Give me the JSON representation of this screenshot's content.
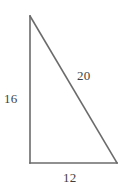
{
  "figure": {
    "name": "right-triangle",
    "background_color": "#ffffff",
    "stroke_color": "#6b6b6b",
    "text_color": "#3f3f3f",
    "stroke_width": 1.6,
    "vertices": {
      "apex": {
        "x": 30,
        "y": 16
      },
      "bottom_left": {
        "x": 30,
        "y": 163
      },
      "bottom_right": {
        "x": 117,
        "y": 163
      }
    },
    "labels": {
      "vertical_leg": "16",
      "hypotenuse": "20",
      "horizontal_leg": "12"
    }
  },
  "chart_data": {
    "type": "diagram",
    "title": "",
    "shape": "right triangle",
    "sides": [
      {
        "name": "vertical-leg",
        "label": "16",
        "value": 16,
        "from": "apex",
        "to": "bottom_left"
      },
      {
        "name": "hypotenuse",
        "label": "20",
        "value": 20,
        "from": "apex",
        "to": "bottom_right"
      },
      {
        "name": "horizontal-leg",
        "label": "12",
        "value": 12,
        "from": "bottom_left",
        "to": "bottom_right"
      }
    ],
    "right_angle_at": "bottom_left",
    "labels": [
      "16",
      "20",
      "12"
    ]
  }
}
